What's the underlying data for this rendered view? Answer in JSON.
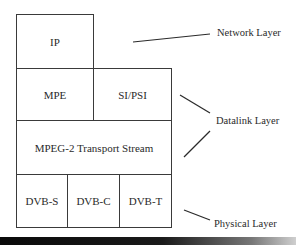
{
  "diagram": {
    "blocks": {
      "ip": "IP",
      "mpe": "MPE",
      "si_psi": "SI/PSI",
      "transport_stream": "MPEG-2 Transport Stream",
      "dvb_s": "DVB-S",
      "dvb_c": "DVB-C",
      "dvb_t": "DVB-T"
    },
    "layers": {
      "network": "Network Layer",
      "datalink": "Datalink Layer",
      "physical": "Physical Layer"
    }
  }
}
